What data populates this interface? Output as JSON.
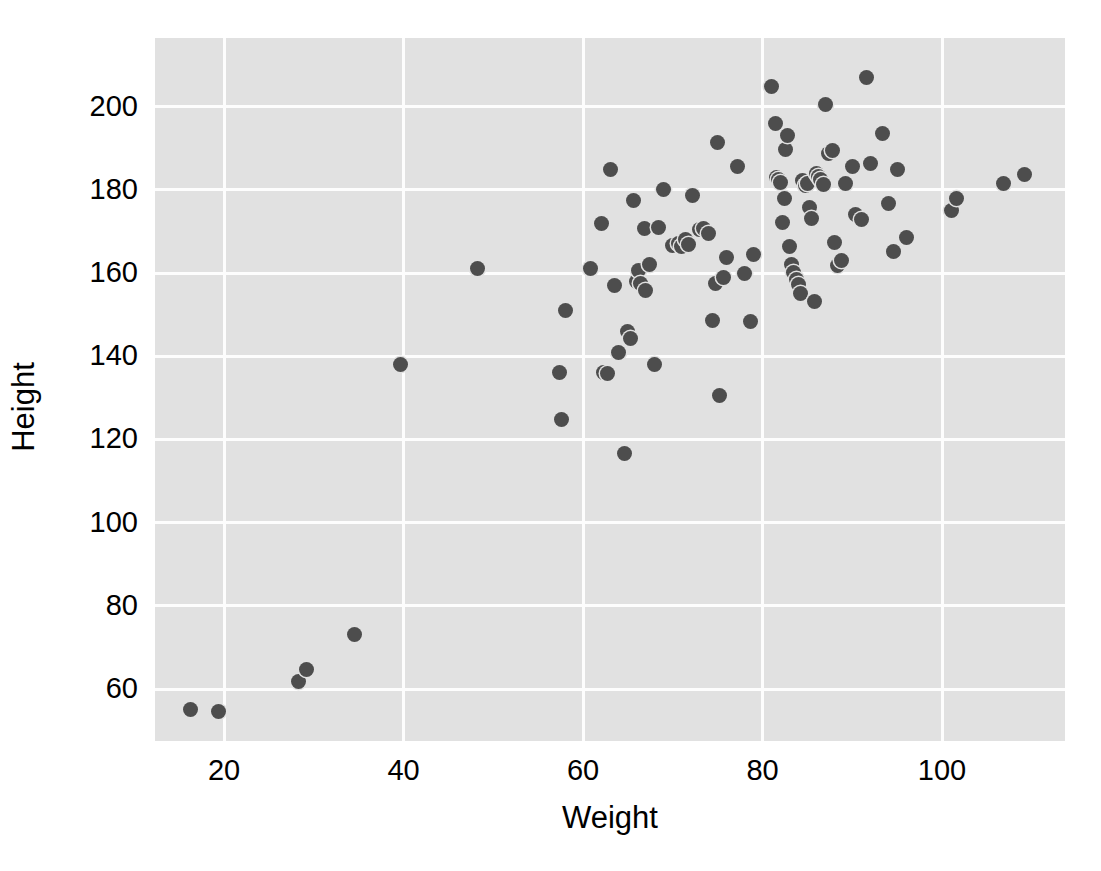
{
  "figure": {
    "width": 1101,
    "height": 871,
    "background_color": "#ffffff",
    "panel_color": "#e1e1e1",
    "gridline_color": "#fdfdfd",
    "point_color": "#4d4d4d"
  },
  "chart_data": {
    "type": "scatter",
    "title": "",
    "xlabel": "Weight",
    "ylabel": "Height",
    "xlim": [
      12.3,
      113.7
    ],
    "ylim": [
      47.5,
      216.5
    ],
    "xticks": [
      20,
      40,
      60,
      80,
      100
    ],
    "yticks": [
      60,
      80,
      100,
      120,
      140,
      160,
      180,
      200
    ],
    "xtick_labels": [
      "20",
      "40",
      "60",
      "80",
      "100"
    ],
    "ytick_labels": [
      "60",
      "80",
      "100",
      "120",
      "140",
      "160",
      "180",
      "200"
    ],
    "grid": true,
    "legend": null,
    "marker": "circle",
    "marker_size": 15,
    "series": [
      {
        "name": "observations",
        "x": [
          16.2,
          19.4,
          28.3,
          29.2,
          34.5,
          39.6,
          48.2,
          57.4,
          57.6,
          58.0,
          60.8,
          62.0,
          62.3,
          62.7,
          63.0,
          63.5,
          64.0,
          64.6,
          65.0,
          65.3,
          65.6,
          66.0,
          66.2,
          66.4,
          66.8,
          67.0,
          67.4,
          68.0,
          68.4,
          69.0,
          70.0,
          70.6,
          71.0,
          71.4,
          71.8,
          72.2,
          73.0,
          73.4,
          74.0,
          74.4,
          74.8,
          75.0,
          75.2,
          75.6,
          76.0,
          77.2,
          78.0,
          78.6,
          79.0,
          81.0,
          81.4,
          81.6,
          81.8,
          82.0,
          82.2,
          82.4,
          82.6,
          82.8,
          83.0,
          83.2,
          83.5,
          83.8,
          84.0,
          84.2,
          84.5,
          84.8,
          85.0,
          85.2,
          85.5,
          85.8,
          86.0,
          86.2,
          86.5,
          86.8,
          87.0,
          87.4,
          87.8,
          88.0,
          88.4,
          88.8,
          89.2,
          90.0,
          90.4,
          91.0,
          91.6,
          92.0,
          93.4,
          94.0,
          94.6,
          95.0,
          96.0,
          101.0,
          101.6,
          106.8,
          109.2
        ],
        "y": [
          55.0,
          54.6,
          61.8,
          64.6,
          73.0,
          138.0,
          161.2,
          136.0,
          124.8,
          151.0,
          161.2,
          172.0,
          136.0,
          135.8,
          185.0,
          157.0,
          140.8,
          116.6,
          146.0,
          144.2,
          177.4,
          158.0,
          160.6,
          157.6,
          170.8,
          155.8,
          162.0,
          138.0,
          171.0,
          180.0,
          166.6,
          167.0,
          166.4,
          168.0,
          166.8,
          178.6,
          170.4,
          170.6,
          169.4,
          148.6,
          157.4,
          191.4,
          130.6,
          159.0,
          163.8,
          185.6,
          159.8,
          148.4,
          164.4,
          204.8,
          196.0,
          183.0,
          182.6,
          181.8,
          172.2,
          178.0,
          189.6,
          193.0,
          166.4,
          162.0,
          160.2,
          158.4,
          157.2,
          155.0,
          182.2,
          181.0,
          181.6,
          175.8,
          173.0,
          153.2,
          184.0,
          183.2,
          182.4,
          181.2,
          200.4,
          188.8,
          189.4,
          167.4,
          161.8,
          163.0,
          181.6,
          185.6,
          174.0,
          172.8,
          207.0,
          186.4,
          193.6,
          176.6,
          165.2,
          184.8,
          168.6,
          175.0,
          177.8,
          181.6,
          183.8
        ]
      }
    ]
  }
}
